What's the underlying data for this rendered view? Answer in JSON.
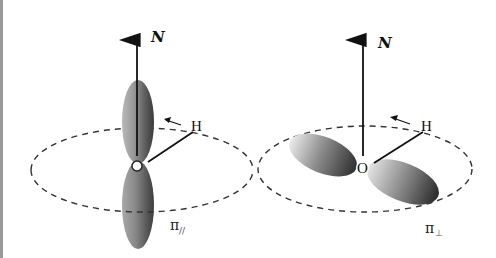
{
  "figure": {
    "left_panel": {
      "axis_label": "N",
      "atom_H": "H",
      "orbital_label": "π",
      "orbital_subscript": "//",
      "description": "π-parallel orbital: lobes aligned with normal axis N"
    },
    "right_panel": {
      "axis_label": "N",
      "atom_H": "H",
      "atom_O": "O",
      "orbital_label": "π",
      "orbital_subscript": "⊥",
      "description": "π-perpendicular orbital: lobes lying in the dashed plane"
    },
    "colors": {
      "lobe_dark": "#3a3a3a",
      "lobe_light": "#d8d8d8",
      "line": "#111111",
      "dashed_ellipse": "#333333",
      "border": "#9a9a9a"
    }
  }
}
